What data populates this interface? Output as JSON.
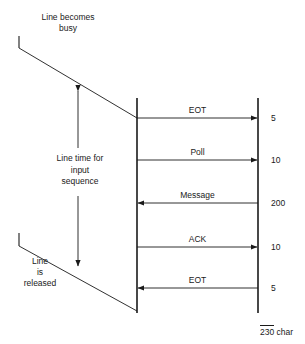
{
  "diagram": {
    "type": "sequence-timing-diagram",
    "stroke_color": "#1a1a1a",
    "background_color": "#ffffff",
    "annotations": {
      "line_busy": "Line becomes\nbusy",
      "line_busy_line1": "Line becomes",
      "line_busy_line2": "busy",
      "line_time_line1": "Line time for",
      "line_time_line2": "input",
      "line_time_line3": "sequence",
      "line_released_line1": "Line",
      "line_released_line2": "is",
      "line_released_line3": "released"
    },
    "messages": [
      {
        "label": "EOT",
        "direction": "right",
        "value": "5",
        "y": 118
      },
      {
        "label": "Poll",
        "direction": "right",
        "value": "10",
        "y": 160
      },
      {
        "label": "Message",
        "direction": "left",
        "value": "200",
        "y": 203
      },
      {
        "label": "ACK",
        "direction": "right",
        "value": "10",
        "y": 247
      },
      {
        "label": "EOT",
        "direction": "left",
        "value": "5",
        "y": 288
      }
    ],
    "total": {
      "value": "230",
      "unit": "char"
    }
  }
}
